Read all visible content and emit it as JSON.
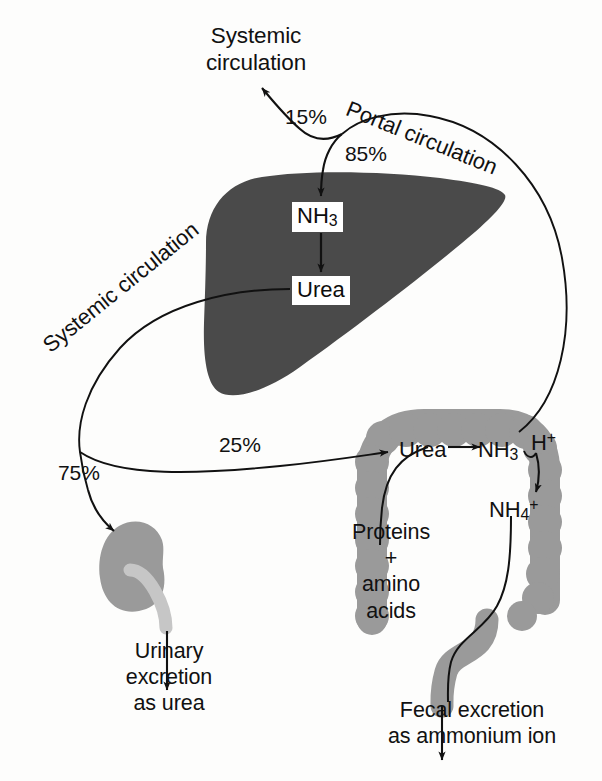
{
  "figure": {
    "background_color": "#fdfdfc",
    "ink_color": "#111111"
  },
  "organs": {
    "liver": {
      "name": "Liver",
      "fill": "#4a4a4a"
    },
    "colon": {
      "name": "Colon",
      "fill": "#9a9a9a"
    },
    "kidney": {
      "name": "Kidney",
      "fill": "#9a9a9a"
    },
    "ureter": {
      "name": "Ureter",
      "fill": "#c6c6c6"
    }
  },
  "labels": {
    "systemic_circulation_top": "Systemic\ncirculation",
    "portal_circulation": "Portal circulation",
    "systemic_circulation_diagonal": "Systemic circulation",
    "urinary_excretion": "Urinary\nexcretion\nas urea",
    "fecal_excretion": "Fecal excretion\nas ammonium ion",
    "proteins_amino_acids": "Proteins\n+\namino\nacids"
  },
  "percentages": {
    "to_systemic_from_portal": "15%",
    "to_liver_from_portal": "85%",
    "to_colon_from_systemic": "25%",
    "to_kidney_from_systemic": "75%"
  },
  "liver_nodes": {
    "ammonia": {
      "text": "NH3",
      "base": "NH",
      "sub": "3"
    },
    "urea": {
      "text": "Urea"
    }
  },
  "colon_nodes": {
    "urea": {
      "text": "Urea"
    },
    "ammonia": {
      "base": "NH",
      "sub": "3"
    },
    "proton": {
      "base": "H",
      "sup": "+"
    },
    "ammonium": {
      "base": "NH",
      "sub": "4",
      "sup": "+"
    }
  }
}
